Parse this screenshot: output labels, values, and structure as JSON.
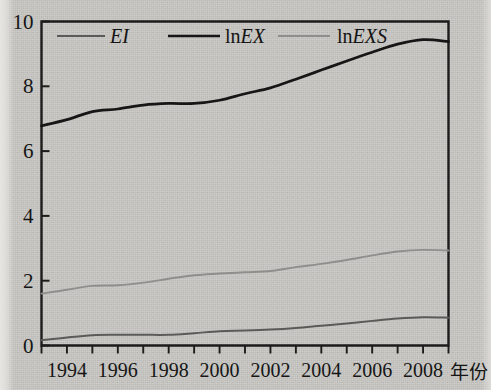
{
  "figure": {
    "background_color": "#c9c8c4",
    "frame_color": "#1c1c1c",
    "xaxis_name": "年份"
  },
  "legend": {
    "position": "top-left-inside",
    "items": [
      {
        "label": "EI",
        "label_plain": "EI",
        "style": "italic",
        "color": "#5a5a58",
        "line_width": 2.0
      },
      {
        "label": "lnEX",
        "label_prefix": "ln",
        "label_italic": "EX",
        "color": "#161616",
        "line_width": 2.6
      },
      {
        "label": "lnEXS",
        "label_prefix": "ln",
        "label_italic": "EXS",
        "color": "#8e8e8c",
        "line_width": 2.0
      }
    ]
  },
  "chart_data": {
    "type": "line",
    "title": "",
    "xlabel": "年份",
    "ylabel": "",
    "xlim": [
      1993,
      2009
    ],
    "ylim": [
      0,
      10
    ],
    "grid": false,
    "y_ticks": [
      0,
      2,
      4,
      6,
      8,
      10
    ],
    "y_ticklabels": [
      "0",
      "2",
      "4",
      "6",
      "8",
      "10"
    ],
    "x_ticks": [
      1993,
      1994,
      1995,
      1996,
      1997,
      1998,
      1999,
      2000,
      2001,
      2002,
      2003,
      2004,
      2005,
      2006,
      2007,
      2008,
      2009
    ],
    "x_ticklabels_shown": [
      "1994",
      "1996",
      "1998",
      "2000",
      "2002",
      "2004",
      "2006",
      "2008"
    ],
    "x_ticklabel_values": [
      1994,
      1996,
      1998,
      2000,
      2002,
      2004,
      2006,
      2008
    ],
    "x": [
      1993,
      1994,
      1995,
      1996,
      1997,
      1998,
      1999,
      2000,
      2001,
      2002,
      2003,
      2004,
      2005,
      2006,
      2007,
      2008,
      2009
    ],
    "series": [
      {
        "name": "lnEX",
        "color": "#161616",
        "values": [
          6.78,
          6.97,
          7.22,
          7.3,
          7.42,
          7.47,
          7.47,
          7.57,
          7.77,
          7.95,
          8.22,
          8.5,
          8.78,
          9.05,
          9.3,
          9.44,
          9.38
        ]
      },
      {
        "name": "lnEXS",
        "color": "#8e8e8c",
        "values": [
          1.6,
          1.72,
          1.84,
          1.86,
          1.94,
          2.06,
          2.17,
          2.22,
          2.26,
          2.3,
          2.42,
          2.52,
          2.64,
          2.78,
          2.9,
          2.95,
          2.93
        ]
      },
      {
        "name": "EI",
        "color": "#5a5a58",
        "values": [
          0.16,
          0.25,
          0.32,
          0.33,
          0.33,
          0.33,
          0.38,
          0.44,
          0.46,
          0.49,
          0.54,
          0.61,
          0.68,
          0.76,
          0.83,
          0.87,
          0.86
        ]
      }
    ]
  }
}
